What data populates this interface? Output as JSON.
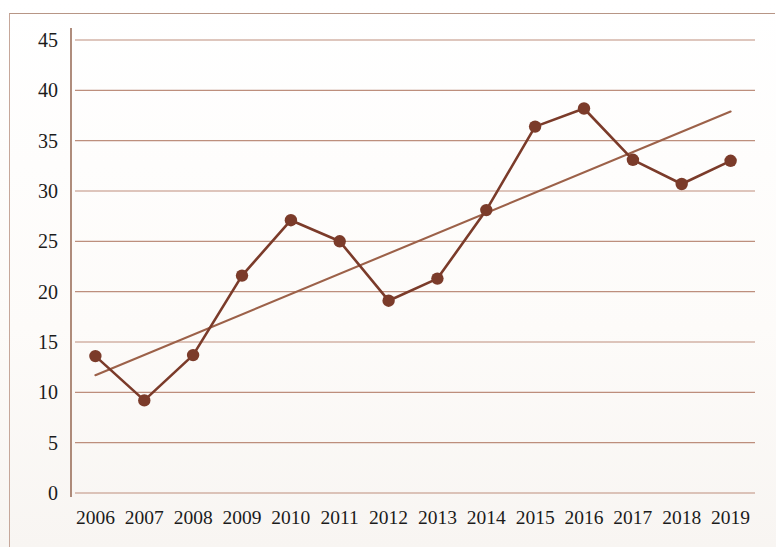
{
  "chart_data": {
    "type": "line",
    "title": "",
    "subtitle": "",
    "xlabel": "",
    "ylabel": "",
    "categories": [
      "2006",
      "2007",
      "2008",
      "2009",
      "2010",
      "2011",
      "2012",
      "2013",
      "2014",
      "2015",
      "2016",
      "2017",
      "2018",
      "2019"
    ],
    "series": [
      {
        "name": "data",
        "type": "line-with-markers",
        "color": "#7b3b2a",
        "values": [
          13.6,
          9.2,
          13.7,
          21.6,
          27.1,
          25.0,
          19.1,
          21.3,
          28.1,
          36.4,
          38.2,
          33.1,
          30.7,
          33.0
        ]
      },
      {
        "name": "trendline",
        "type": "linear-trend",
        "color": "#9c6149",
        "start": {
          "x": "2006",
          "y": 11.7
        },
        "end": {
          "x": "2019",
          "y": 37.9
        }
      }
    ],
    "ylim": [
      0,
      45
    ],
    "ytick_step": 5,
    "yticks": [
      "0",
      "5",
      "10",
      "15",
      "20",
      "25",
      "30",
      "35",
      "40",
      "45"
    ],
    "xticks": [
      "2006",
      "2007",
      "2008",
      "2009",
      "2010",
      "2011",
      "2012",
      "2013",
      "2014",
      "2015",
      "2016",
      "2017",
      "2018",
      "2019"
    ],
    "grid": {
      "horizontal": true,
      "vertical": false,
      "color": "#b5806c"
    },
    "legend": {
      "visible": false,
      "position": "none"
    },
    "axis": {
      "left_line": true,
      "bottom_line": false
    },
    "background": "#ffffff"
  },
  "page": {
    "frame_color": "#c0a090"
  }
}
